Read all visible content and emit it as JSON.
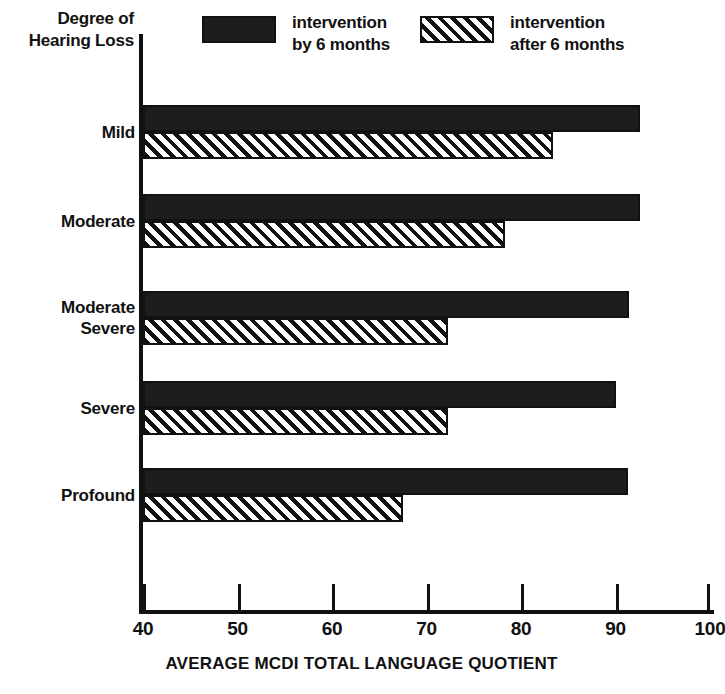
{
  "chart_data": {
    "type": "bar",
    "orientation": "horizontal",
    "title": "",
    "xlabel": "AVERAGE MCDI TOTAL LANGUAGE QUOTIENT",
    "ylabel": "Degree of Hearing Loss",
    "categories": [
      "Mild",
      "Moderate",
      "Moderate Severe",
      "Severe",
      "Profound"
    ],
    "category_lines": [
      [
        "Mild"
      ],
      [
        "Moderate"
      ],
      [
        "Moderate",
        "Severe"
      ],
      [
        "Severe"
      ],
      [
        "Profound"
      ]
    ],
    "series": [
      {
        "name": "intervention by 6 months",
        "name_lines": [
          "intervention",
          "by 6 months"
        ],
        "style": "solid",
        "color": "#1d1d1d",
        "values": [
          92.6,
          92.6,
          91.4,
          90.0,
          91.3
        ]
      },
      {
        "name": "intervention after 6 months",
        "name_lines": [
          "intervention",
          "after 6 months"
        ],
        "style": "hatched",
        "color": "#ffffff",
        "values": [
          83.4,
          78.3,
          72.3,
          72.3,
          67.5
        ]
      }
    ],
    "xlim": [
      40,
      100
    ],
    "xticks": [
      40,
      50,
      60,
      70,
      80,
      90,
      100
    ],
    "xtick_labels": [
      "40",
      "50",
      "60",
      "70",
      "80",
      "90",
      "100"
    ],
    "grid": false,
    "legend_position": "top"
  },
  "axis_title": {
    "lines": [
      "Degree of",
      "Hearing Loss"
    ]
  },
  "colors": {
    "ink": "#111111",
    "solid_fill": "#1d1d1d",
    "background": "#ffffff"
  }
}
